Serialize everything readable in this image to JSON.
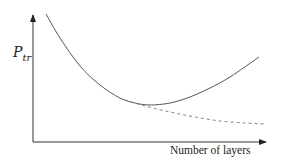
{
  "chart_data": {
    "type": "line",
    "title": "",
    "xlabel": "Number of layers",
    "ylabel": "P_tr",
    "ylabel_main": "P",
    "ylabel_sub": "tr",
    "grid": false,
    "legend": null,
    "ticks": "none",
    "series": [
      {
        "name": "solid-curve",
        "style": "solid",
        "description": "Decreases steeply, reaches a minimum, then rises again (U-shaped)",
        "points_px": [
          [
            46,
            14
          ],
          [
            60,
            38
          ],
          [
            80,
            66
          ],
          [
            100,
            85
          ],
          [
            120,
            98
          ],
          [
            135,
            103
          ],
          [
            150,
            105
          ],
          [
            170,
            103
          ],
          [
            190,
            97
          ],
          [
            210,
            88
          ],
          [
            230,
            77
          ],
          [
            259,
            57
          ]
        ]
      },
      {
        "name": "dashed-curve",
        "style": "dashed",
        "description": "Follows the solid curve, then keeps decreasing and flattens out asymptotically",
        "points_px": [
          [
            125,
            100
          ],
          [
            145,
            106
          ],
          [
            170,
            112
          ],
          [
            195,
            117
          ],
          [
            220,
            121
          ],
          [
            245,
            123
          ],
          [
            265,
            124
          ]
        ]
      }
    ],
    "colors": {
      "solid": "#444444",
      "dashed": "#777777",
      "axis": "#333333"
    }
  }
}
